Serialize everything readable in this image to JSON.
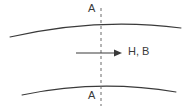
{
  "figure": {
    "type": "technical-diagram",
    "background_color": "#ffffff",
    "line_color": "#3a3a3a",
    "dash_color": "#6b6b6b",
    "text_color": "#3a3a3a",
    "labels": {
      "section_top": "A",
      "section_bottom": "A",
      "field": "H, B"
    },
    "elements": {
      "upper_curve": {
        "name": "upper-boundary-curve",
        "start": [
          10,
          37
        ],
        "control": [
          98,
          17
        ],
        "end": [
          181,
          28
        ]
      },
      "lower_curve": {
        "name": "lower-boundary-curve",
        "start": [
          22,
          95
        ],
        "control": [
          98,
          79
        ],
        "end": [
          176,
          92
        ]
      },
      "section_line": {
        "name": "section-line-a-a",
        "x": 101,
        "y_start": 8,
        "y_end": 106,
        "dash": "3 3"
      },
      "field_arrow": {
        "name": "field-direction-arrow",
        "x_start": 76,
        "x_end": 122,
        "y": 53
      }
    }
  }
}
